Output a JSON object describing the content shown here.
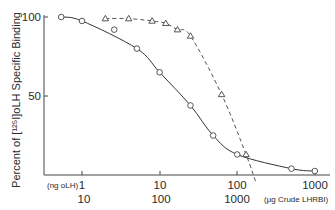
{
  "chart_data": {
    "type": "line",
    "title": "",
    "ylabel": "Percent of [125I]oLH Specific Binding",
    "xlabel_primary": "(ng oLH)",
    "xlabel_secondary": "(µg Crude LHRBI)",
    "x_scale": "log",
    "xlim": [
      0.4,
      1500
    ],
    "ylim": [
      0,
      100
    ],
    "yticks": [
      50,
      100
    ],
    "ytick_labels": [
      "50",
      "100"
    ],
    "xticks_primary": [
      1,
      10,
      100,
      1000
    ],
    "xtick_labels_primary": [
      "1",
      "10",
      "100",
      "1000"
    ],
    "xtick_labels_secondary": [
      "10",
      "100",
      "1000"
    ],
    "grid": false,
    "legend": null,
    "series": [
      {
        "name": "oLH (circles, solid line)",
        "marker": "circle",
        "line": "solid",
        "x": [
          0.54,
          1.0,
          2.6,
          5.1,
          10,
          25,
          49,
          100,
          500,
          1000
        ],
        "y": [
          100,
          97.5,
          92,
          80,
          65,
          44,
          25,
          13,
          4,
          2.5
        ]
      },
      {
        "name": "Crude LHRBI (triangles, dashed line)",
        "marker": "triangle",
        "line": "dashed",
        "x": [
          2,
          4,
          8,
          12,
          17,
          25,
          63,
          130
        ],
        "y": [
          99,
          99,
          97.5,
          96,
          92,
          88,
          51,
          13
        ]
      }
    ]
  },
  "labels": {
    "y_axis_title": "Percent of [¹²⁵I]oLH Specific Binding",
    "ytick_100": "100",
    "ytick_50": "50",
    "x_unit_primary": "(ng oLH)",
    "x_unit_secondary": "(µg Crude LHRBI)",
    "xt1": "1",
    "xt2": "10",
    "xt3": "100",
    "xt4": "1000",
    "xs1": "10",
    "xs2": "100",
    "xs3": "1000"
  }
}
